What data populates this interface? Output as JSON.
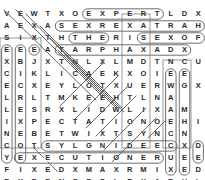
{
  "puzzle": {
    "title": "word-search-grid",
    "rows": 15,
    "cols": 15,
    "cell_width": 13.6667,
    "cell_height": 12.0,
    "origin_x": 0,
    "origin_y": 8,
    "letter_color": "#2a2a2a",
    "background_color": "#ffffff",
    "mark_color": "#6f6f6f",
    "mark_color_dark": "#1f1f1f",
    "grid": [
      [
        "V",
        "E",
        "W",
        "T",
        "X",
        "O",
        "E",
        "X",
        "P",
        "E",
        "R",
        "T",
        "L",
        "D",
        "X"
      ],
      [
        "A",
        "E",
        "X",
        "A",
        "S",
        "E",
        "X",
        "R",
        "E",
        "X",
        "A",
        "T",
        "R",
        "A",
        "H"
      ],
      [
        "S",
        "I",
        "X",
        "T",
        "H",
        "T",
        "H",
        "E",
        "R",
        "I",
        "S",
        "E",
        "X",
        "O",
        "F"
      ],
      [
        "E",
        "E",
        "E",
        "A",
        "T",
        "A",
        "R",
        "P",
        "H",
        "A",
        "X",
        "A",
        "D",
        "X",
        ""
      ],
      [
        "X",
        "B",
        "J",
        "X",
        "T",
        "N",
        "L",
        "X",
        "L",
        "M",
        "D",
        "T",
        "N",
        "C",
        "U"
      ],
      [
        "C",
        "I",
        "K",
        "L",
        "I",
        "C",
        "A",
        "E",
        "K",
        "X",
        "O",
        "I",
        "E",
        "E",
        ""
      ],
      [
        "E",
        "C",
        "X",
        "E",
        "Y",
        "L",
        "O",
        "T",
        "X",
        "U",
        "E",
        "R",
        "W",
        "G",
        "X"
      ],
      [
        "L",
        "R",
        "L",
        "T",
        "M",
        "K",
        "E",
        "E",
        "H",
        "T",
        "L",
        "N",
        "A",
        "",
        ""
      ],
      [
        "L",
        "E",
        "S",
        "R",
        "X",
        "L",
        "I",
        "D",
        "W",
        "L",
        "I",
        "X",
        "A",
        "M",
        ""
      ],
      [
        "I",
        "X",
        "P",
        "E",
        "C",
        "T",
        "A",
        "T",
        "I",
        "O",
        "N",
        "O",
        "E",
        "H",
        "I"
      ],
      [
        "N",
        "E",
        "B",
        "E",
        "T",
        "W",
        "I",
        "X",
        "T",
        "S",
        "Y",
        "N",
        "C",
        "N",
        ""
      ],
      [
        "C",
        "O",
        "T",
        "S",
        "Y",
        "L",
        "G",
        "N",
        "I",
        "D",
        "E",
        "E",
        "C",
        "X",
        "D"
      ],
      [
        "Y",
        "E",
        "X",
        "E",
        "C",
        "U",
        "T",
        "I",
        "O",
        "N",
        "E",
        "R",
        "U",
        "E",
        "E"
      ],
      [
        "F",
        "I",
        "X",
        "E",
        "D",
        "X",
        "M",
        "A",
        "X",
        "R",
        "M",
        "I",
        "X",
        "E",
        "D"
      ],
      [
        "E",
        "X",
        "P",
        "E",
        "N",
        "S",
        "E",
        "S",
        "L",
        "E",
        "X",
        "A",
        "R",
        "H",
        "L"
      ]
    ],
    "found_words": [
      {
        "text": "EXPERT",
        "type": "horizontal",
        "row": 0,
        "start_col": 6,
        "end_col": 11
      },
      {
        "text": "SEXREXATRAH",
        "type": "horizontal",
        "row": 1,
        "start_col": 4,
        "end_col": 14
      },
      {
        "text": "THE",
        "type": "horizontal",
        "row": 2,
        "start_col": 5,
        "end_col": 7
      },
      {
        "text": "SEXOF",
        "type": "horizontal",
        "row": 2,
        "start_col": 10,
        "end_col": 14
      },
      {
        "text": "TARPHAXAD",
        "type": "horizontal",
        "row": 3,
        "start_col": 4,
        "end_col": 13
      },
      {
        "text": "YLGNIDEEC",
        "type": "horizontal",
        "row": 11,
        "start_col": 3,
        "end_col": 12
      },
      {
        "text": "EXECUTIONER",
        "type": "horizontal",
        "row": 12,
        "start_col": 1,
        "end_col": 11
      },
      {
        "text": "E-VERT-1",
        "type": "vertical",
        "col": 0,
        "start_row": 3,
        "end_row": 12
      },
      {
        "text": "E-VERT-2",
        "type": "vertical",
        "col": 1,
        "start_row": 3,
        "end_row": 12
      },
      {
        "text": "E-VERT-3",
        "type": "vertical",
        "col": 2,
        "start_row": 3,
        "end_row": 3
      },
      {
        "text": "E-VERT-4",
        "type": "vertical",
        "col": 12,
        "start_row": 5,
        "end_row": 13
      },
      {
        "text": "E-VERT-5",
        "type": "vertical",
        "col": 13,
        "start_row": 5,
        "end_row": 13
      },
      {
        "text": "D-VERT",
        "type": "vertical",
        "col": 14,
        "start_row": 11,
        "end_row": 12
      }
    ],
    "strike_lines": [
      {
        "name": "diag-1",
        "x1": 4,
        "y1": 10,
        "x2": 96,
        "y2": 100
      },
      {
        "name": "diag-2",
        "x1": 16,
        "y1": 10,
        "x2": 104,
        "y2": 98
      },
      {
        "name": "diag-3",
        "x1": 26,
        "y1": 14,
        "x2": 96,
        "y2": 86
      },
      {
        "name": "diag-4",
        "x1": 40,
        "y1": 26,
        "x2": 100,
        "y2": 86
      },
      {
        "name": "diag-5",
        "x1": 50,
        "y1": 38,
        "x2": 108,
        "y2": 96
      },
      {
        "name": "diag-6",
        "x1": 58,
        "y1": 50,
        "x2": 116,
        "y2": 108
      },
      {
        "name": "diag-7",
        "x1": 66,
        "y1": 56,
        "x2": 118,
        "y2": 108
      },
      {
        "name": "diag-8",
        "x1": 76,
        "y1": 62,
        "x2": 122,
        "y2": 108
      },
      {
        "name": "diag-9",
        "x1": 86,
        "y1": 74,
        "x2": 124,
        "y2": 112
      },
      {
        "name": "anti-1",
        "x1": 104,
        "y1": 62,
        "x2": 60,
        "y2": 106
      },
      {
        "name": "anti-2",
        "x1": 118,
        "y1": 76,
        "x2": 74,
        "y2": 120
      },
      {
        "name": "anti-3",
        "x1": 128,
        "y1": 86,
        "x2": 86,
        "y2": 128
      },
      {
        "name": "anti-4",
        "x1": 136,
        "y1": 96,
        "x2": 96,
        "y2": 136
      },
      {
        "name": "anti-5",
        "x1": 146,
        "y1": 108,
        "x2": 104,
        "y2": 150
      },
      {
        "name": "anti-6",
        "x1": 156,
        "y1": 118,
        "x2": 112,
        "y2": 162
      },
      {
        "name": "anti-7",
        "x1": 166,
        "y1": 120,
        "x2": 148,
        "y2": 138
      },
      {
        "name": "small-1",
        "x1": 44,
        "y1": 158,
        "x2": 34,
        "y2": 148
      },
      {
        "name": "small-2",
        "x1": 58,
        "y1": 172,
        "x2": 48,
        "y2": 162
      }
    ],
    "boxes": [
      {
        "name": "col-box-left",
        "x": 0,
        "y": 38,
        "w": 41,
        "h": 110
      },
      {
        "name": "col-box-mid",
        "x": 122,
        "y": 14,
        "w": 28,
        "h": 134
      },
      {
        "name": "col-box-right",
        "x": 163,
        "y": 60,
        "w": 28,
        "h": 88
      }
    ]
  }
}
